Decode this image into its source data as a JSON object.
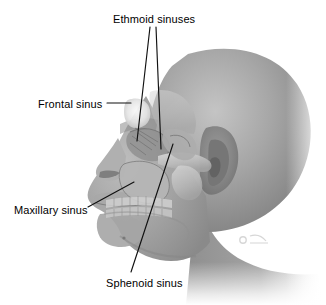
{
  "figure": {
    "background_color": "#ffffff",
    "label_color": "#000000",
    "leader_line_color": "#111111",
    "skin_tone": "#9a9a9a",
    "bone_tone": "#c9c9c9",
    "highlight_tone": "#f2f2f2",
    "watermark_text": "",
    "width": 326,
    "height": 305
  },
  "labels": [
    {
      "id": "ethmoid",
      "text": "Ethmoid sinuses",
      "x": 113,
      "y": 13
    },
    {
      "id": "frontal",
      "text": "Frontal sinus",
      "x": 38,
      "y": 98
    },
    {
      "id": "maxillary",
      "text": "Maxillary sinus",
      "x": 14,
      "y": 204
    },
    {
      "id": "sphenoid",
      "text": "Sphenoid sinus",
      "x": 106,
      "y": 277
    }
  ],
  "leader_lines": [
    {
      "id": "ethmoid-left",
      "from": [
        150,
        27
      ],
      "to": [
        137,
        141
      ]
    },
    {
      "id": "ethmoid-right",
      "from": [
        156,
        27
      ],
      "to": [
        161,
        149
      ]
    },
    {
      "id": "frontal",
      "from": [
        107,
        103
      ],
      "to": [
        131,
        103
      ]
    },
    {
      "id": "maxillary",
      "from": [
        88,
        207
      ],
      "to": [
        134,
        182
      ]
    },
    {
      "id": "sphenoid",
      "from": [
        131,
        272
      ],
      "to": [
        173,
        144
      ]
    }
  ]
}
